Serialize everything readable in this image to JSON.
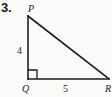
{
  "figure": {
    "problem_number": "3.",
    "background_color": "#fbfbf9",
    "line_color": "#1d1d1d",
    "text_color": "#1d1d1d"
  },
  "triangle": {
    "type": "right-triangle",
    "vertices": [
      {
        "name": "P",
        "label": "P",
        "position": "top-left-apex",
        "x": 28,
        "y": 16
      },
      {
        "name": "Q",
        "label": "Q",
        "position": "bottom-left-right-angle",
        "x": 28,
        "y": 79
      },
      {
        "name": "R",
        "label": "R",
        "position": "bottom-right",
        "x": 108,
        "y": 79
      }
    ],
    "right_angle_at": "Q",
    "sides": [
      {
        "name": "PQ",
        "label": "4",
        "orientation": "vertical",
        "from": "P",
        "to": "Q"
      },
      {
        "name": "QR",
        "label": "5",
        "orientation": "horizontal",
        "from": "Q",
        "to": "R"
      },
      {
        "name": "PR",
        "label": "",
        "orientation": "hypotenuse",
        "from": "P",
        "to": "R"
      }
    ]
  },
  "labels": {
    "vertex_P": "P",
    "vertex_Q": "Q",
    "vertex_R": "R",
    "leg_vertical": "4",
    "leg_horizontal": "5"
  }
}
